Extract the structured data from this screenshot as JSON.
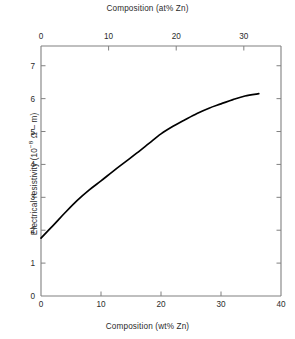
{
  "chart_data": {
    "type": "line",
    "title": "",
    "top_axis": {
      "label": "Composition (at% Zn)",
      "ticks": [
        0,
        10,
        20,
        30
      ],
      "tick_labels": [
        "0",
        "10",
        "20",
        "30"
      ],
      "range": [
        0,
        35.5
      ]
    },
    "xlabel": "Composition (wt% Zn)",
    "x_ticks": [
      0,
      10,
      20,
      30,
      40
    ],
    "x_tick_labels": [
      "0",
      "10",
      "20",
      "30",
      "40"
    ],
    "xlim": [
      0,
      40
    ],
    "ylabel": "Electrical resistivity (10−8 Ω – m)",
    "ylabel_prefix": "Electrical resistivity (10",
    "ylabel_exponent": "−8",
    "ylabel_suffix": " Ω – m)",
    "y_ticks": [
      0,
      1,
      2,
      3,
      4,
      5,
      6,
      7
    ],
    "y_tick_labels": [
      "0",
      "1",
      "2",
      "3",
      "4",
      "5",
      "6",
      "7"
    ],
    "ylim": [
      0,
      7.6
    ],
    "grid": false,
    "legend": false,
    "line_color": "#000000",
    "axis_color": "#808080",
    "series": [
      {
        "name": "Cu-Zn alloy resistivity",
        "x": [
          0,
          2,
          4,
          6,
          8,
          10,
          12,
          14,
          16,
          18,
          20,
          22,
          24,
          26,
          28,
          30,
          32,
          34,
          36.3
        ],
        "values": [
          1.76,
          2.14,
          2.53,
          2.9,
          3.22,
          3.5,
          3.79,
          4.07,
          4.35,
          4.64,
          4.93,
          5.16,
          5.36,
          5.55,
          5.71,
          5.84,
          5.97,
          6.08,
          6.15
        ]
      }
    ]
  },
  "figure": {
    "plot_area": {
      "left": 41,
      "right": 281,
      "top": 46,
      "bottom": 296
    }
  }
}
